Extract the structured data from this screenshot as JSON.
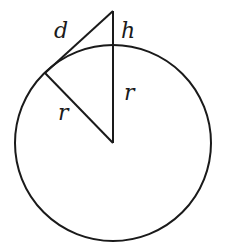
{
  "diagram": {
    "type": "geometry",
    "stroke_color": "#1a1a1a",
    "background_color": "#ffffff",
    "labels": {
      "d": "d",
      "h": "h",
      "r_vertical": "r",
      "r_slanted": "r"
    },
    "circle": {
      "cx": 113,
      "cy": 143,
      "r": 98
    },
    "points": {
      "center": [
        113,
        143
      ],
      "apex": [
        113,
        11
      ],
      "tangent_point": [
        45,
        73
      ],
      "circle_top": [
        113,
        45
      ]
    }
  }
}
